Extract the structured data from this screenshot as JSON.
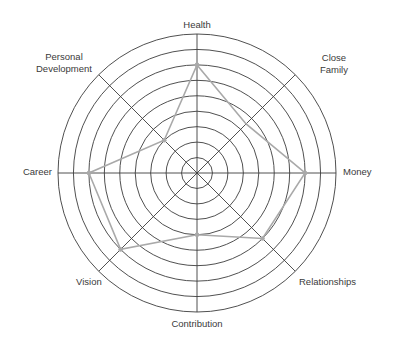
{
  "chart_data": {
    "type": "radar",
    "title": "",
    "categories": [
      "Health",
      "Close Family",
      "Money",
      "Relationships",
      "Contribution",
      "Vision",
      "Career",
      "Personal Development"
    ],
    "series": [
      {
        "name": "Score",
        "values": [
          7,
          4.5,
          7,
          6,
          4,
          7,
          7,
          3
        ]
      }
    ],
    "rings": 9,
    "range": [
      0,
      9
    ],
    "grid": true,
    "legend": "none",
    "colors": {
      "grid": "#3c3c3c",
      "series": "#a9a9a9",
      "label": "#3a3a3a"
    }
  },
  "labels": {
    "health": "Health",
    "close_family_1": "Close",
    "close_family_2": "Family",
    "money": "Money",
    "relationships": "Relationships",
    "contribution": "Contribution",
    "vision": "Vision",
    "career": "Career",
    "personal_development_1": "Personal",
    "personal_development_2": "Development"
  }
}
